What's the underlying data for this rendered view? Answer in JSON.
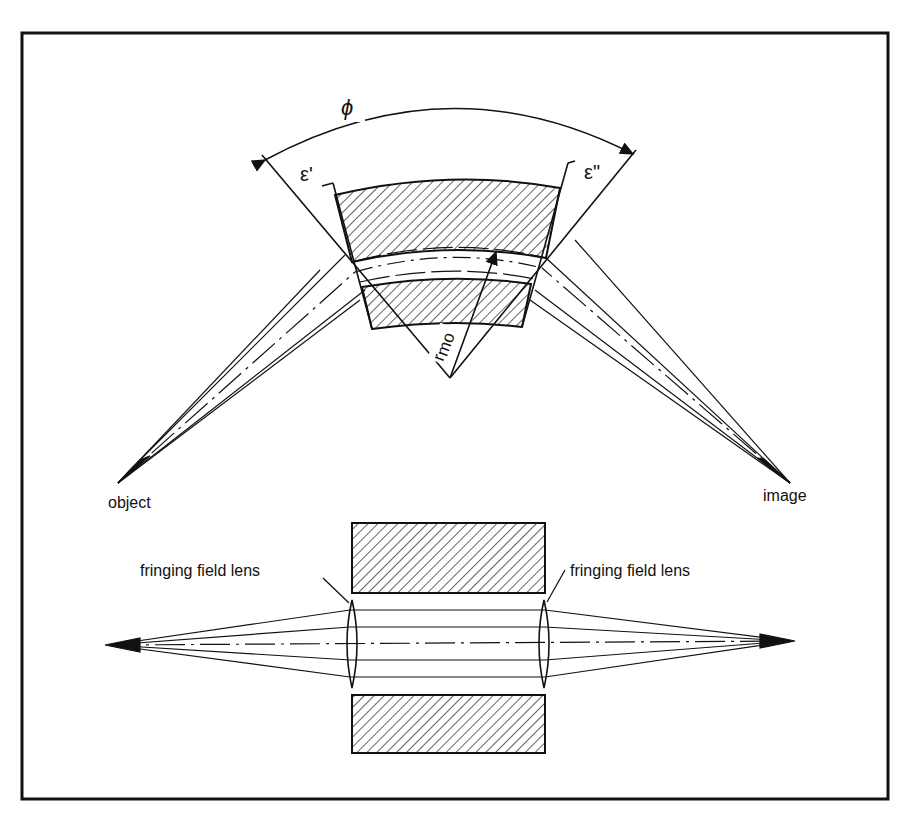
{
  "figure": {
    "type": "sector magnet ion-optics diagram",
    "top_diagram": {
      "labels": {
        "sector_angle": "ϕ",
        "entrance_angle": "ε'",
        "exit_angle": "ε\"",
        "radius": "r",
        "radius_subscript": "mo",
        "object": "object",
        "image": "image"
      }
    },
    "bottom_diagram": {
      "labels": {
        "left_lens": "fringing field lens",
        "right_lens": "fringing field lens"
      }
    },
    "colors": {
      "ink": "#111111",
      "background": "#ffffff"
    }
  }
}
